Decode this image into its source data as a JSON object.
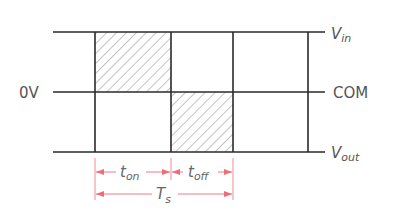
{
  "diagram": {
    "levels": {
      "top": {
        "label_main": "V",
        "label_sub": "in"
      },
      "middle_left": {
        "label": "0V"
      },
      "middle_right": {
        "label": "COM"
      },
      "bottom": {
        "label_main": "V",
        "label_sub": "out"
      }
    },
    "intervals": {
      "on": {
        "label_main": "t",
        "label_sub": "on"
      },
      "off": {
        "label_main": "t",
        "label_sub": "off"
      },
      "period": {
        "label_main": "T",
        "label_sub": "s"
      }
    },
    "colors": {
      "line": "#2a2a2a",
      "hatch": "#8a8a8a",
      "dimension": "#f06a78",
      "text": "#555555"
    }
  }
}
